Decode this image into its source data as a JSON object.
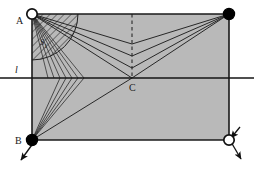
{
  "figure": {
    "canvas": {
      "width": 261,
      "height": 174
    },
    "colors": {
      "background": "#ffffff",
      "region_fill": "#b9b9b9",
      "stroke": "#1a1a1a",
      "thin_stroke": "#333333",
      "hatch": "#2b2b2b",
      "vertex_fill_solid": "#000000",
      "vertex_fill_open": "#ffffff"
    }
  },
  "labels": {
    "point_a": "A",
    "point_b": "B",
    "point_c": "C",
    "line_l": "l",
    "sector_s1": "S",
    "sector_s1_sub": "1"
  },
  "geometry": {
    "rectangle": {
      "name": "shaded-region",
      "x": 32,
      "y": 14,
      "width": 197,
      "height": 126,
      "fill": "#b9b9b9"
    },
    "points": {
      "A": {
        "x": 32,
        "y": 14,
        "marker": "open-circle",
        "radius": 5.2
      },
      "D": {
        "x": 229,
        "y": 14,
        "marker": "filled-circle",
        "radius": 5.6
      },
      "B": {
        "x": 32,
        "y": 140,
        "marker": "filled-circle",
        "radius": 5.6
      },
      "E": {
        "x": 229,
        "y": 140,
        "marker": "open-circle",
        "radius": 5.2
      },
      "C": {
        "x": 132,
        "y": 78,
        "marker": "none",
        "radius": 0
      }
    },
    "line_l": {
      "x1": 0,
      "y1": 78,
      "x2": 254,
      "y2": 78
    },
    "dashed_vertical": {
      "x": 132,
      "y1": 14,
      "y2": 78
    },
    "fan_from_a": [
      {
        "to_x": 72,
        "to_y": 78
      },
      {
        "to_x": 82,
        "to_y": 78
      },
      {
        "to_x": 60,
        "to_y": 78
      },
      {
        "to_x": 132,
        "to_y": 44
      },
      {
        "to_x": 132,
        "to_y": 54
      },
      {
        "to_x": 132,
        "to_y": 64
      },
      {
        "to_x": 132,
        "to_y": 78
      }
    ],
    "fan_from_d": [
      {
        "to_x": 132,
        "to_y": 44
      },
      {
        "to_x": 132,
        "to_y": 54
      },
      {
        "to_x": 132,
        "to_y": 64
      },
      {
        "to_x": 132,
        "to_y": 78
      }
    ],
    "fan_from_b": [
      {
        "to_x": 72,
        "to_y": 78
      },
      {
        "to_x": 82,
        "to_y": 78
      },
      {
        "to_x": 60,
        "to_y": 78
      },
      {
        "to_x": 132,
        "to_y": 78
      },
      {
        "to_x": 32,
        "to_y": 14
      }
    ],
    "sector_s1": {
      "center_x": 32,
      "center_y": 14,
      "radius": 46,
      "start_angle_deg": 0,
      "end_angle_deg": 90
    },
    "arrows": [
      {
        "name": "arrow-from-b",
        "x1": 32,
        "y1": 140,
        "x2": 20,
        "y2": 158
      },
      {
        "name": "arrow-from-e",
        "x1": 229,
        "y1": 140,
        "x2": 241,
        "y2": 158
      },
      {
        "name": "arrow-into-e",
        "x1": 241,
        "y1": 128,
        "x2": 229,
        "y2": 140
      }
    ]
  },
  "label_positions": {
    "point_a": {
      "x": 16,
      "y": 11
    },
    "point_b": {
      "x": 16,
      "y": 136
    },
    "point_c": {
      "x": 132,
      "y": 82
    },
    "line_l": {
      "x": 15,
      "y": 66
    },
    "sector_s1": {
      "x": 40,
      "y": 40
    }
  }
}
